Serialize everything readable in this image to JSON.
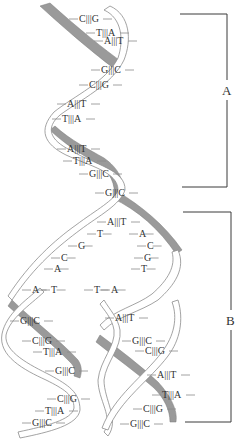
{
  "diagram": {
    "colors": {
      "backbone_dark": "#9a9a9a",
      "backbone_light": "#ffffff",
      "outline": "#8c8c8c",
      "text": "#333333"
    },
    "brackets": [
      {
        "label": "A",
        "meaning": "parent double helix",
        "top": 14,
        "bottom": 187,
        "x_left": 180,
        "x_right": 227
      },
      {
        "label": "B",
        "meaning": "two daughter helices",
        "top": 212,
        "bottom": 422,
        "x_left": 183,
        "x_right": 231
      }
    ],
    "parent_pairs": [
      {
        "text": "C|||G",
        "x": 79,
        "y": 22
      },
      {
        "text": "T|||A",
        "x": 96,
        "y": 36
      },
      {
        "text": "A|||T",
        "x": 104,
        "y": 44
      },
      {
        "text": "G|||C",
        "x": 101,
        "y": 73
      },
      {
        "text": "C|||G",
        "x": 89,
        "y": 88
      },
      {
        "text": "A|||T",
        "x": 67,
        "y": 107
      },
      {
        "text": "T|||A",
        "x": 62,
        "y": 122
      },
      {
        "text": "A|||T",
        "x": 67,
        "y": 152
      },
      {
        "text": "T|||A",
        "x": 73,
        "y": 164
      },
      {
        "text": "G|||C",
        "x": 89,
        "y": 177
      },
      {
        "text": "G|||C",
        "x": 105,
        "y": 196
      }
    ],
    "fork_pairs": [
      {
        "text": "A|||T",
        "x": 107,
        "y": 225
      }
    ],
    "fork_left_bases": [
      {
        "text": "T",
        "x": 97,
        "y": 237
      },
      {
        "text": "G",
        "x": 78,
        "y": 249
      },
      {
        "text": "C",
        "x": 61,
        "y": 261
      },
      {
        "text": "A",
        "x": 54,
        "y": 272
      },
      {
        "text": "A",
        "x": 32,
        "y": 293
      },
      {
        "text": "T",
        "x": 51,
        "y": 293
      }
    ],
    "fork_right_bases": [
      {
        "text": "A",
        "x": 139,
        "y": 237
      },
      {
        "text": "C",
        "x": 147,
        "y": 249
      },
      {
        "text": "G",
        "x": 144,
        "y": 261
      },
      {
        "text": "T",
        "x": 141,
        "y": 272
      },
      {
        "text": "T",
        "x": 94,
        "y": 293
      },
      {
        "text": "A",
        "x": 111,
        "y": 293
      }
    ],
    "left_daughter_pairs": [
      {
        "text": "G|||C",
        "x": 20,
        "y": 324
      },
      {
        "text": "C|||G",
        "x": 32,
        "y": 344
      },
      {
        "text": "T|||A",
        "x": 43,
        "y": 355
      },
      {
        "text": "G|||C",
        "x": 55,
        "y": 374
      },
      {
        "text": "C|||G",
        "x": 57,
        "y": 402
      },
      {
        "text": "T|||A",
        "x": 45,
        "y": 414
      },
      {
        "text": "G|||C",
        "x": 32,
        "y": 426
      }
    ],
    "right_daughter_pairs": [
      {
        "text": "A|||T",
        "x": 115,
        "y": 321
      },
      {
        "text": "G|||C",
        "x": 132,
        "y": 344
      },
      {
        "text": "C|||G",
        "x": 145,
        "y": 354
      },
      {
        "text": "A|||T",
        "x": 157,
        "y": 378
      },
      {
        "text": "T|||A",
        "x": 162,
        "y": 398
      },
      {
        "text": "C|||G",
        "x": 143,
        "y": 412
      },
      {
        "text": "G|||C",
        "x": 130,
        "y": 427
      }
    ]
  }
}
